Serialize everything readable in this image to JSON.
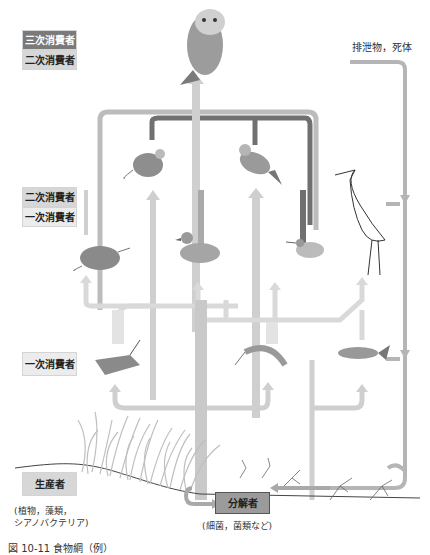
{
  "trophic_labels": {
    "tertiary_top": "三次消費者",
    "secondary_top": "二次消費者",
    "secondary_mid": "二次消費者",
    "primary_mid": "一次消費者",
    "primary_low": "一次消費者",
    "producer": "生産者"
  },
  "producer_note": [
    "(植物，藻類，",
    " シアノバクテリア)"
  ],
  "decomposer": {
    "label": "分解者",
    "note": "(細菌，菌類など)"
  },
  "excretion_label": "排泄物，死体",
  "organisms": [
    "owl",
    "mouse",
    "songbird",
    "heron",
    "shrew",
    "duck",
    "sandpiper",
    "grasshopper",
    "shrimp",
    "fish",
    "grass"
  ],
  "caption": "図 10-11 食物網（例）",
  "colors": {
    "dark_arrow": "#6f6f6f",
    "mid_arrow": "#a9a9a9",
    "light_arrow": "#d6d6d6",
    "pale_arrow": "#e6e6e6",
    "decomposer_box": "#9b9b9b"
  }
}
